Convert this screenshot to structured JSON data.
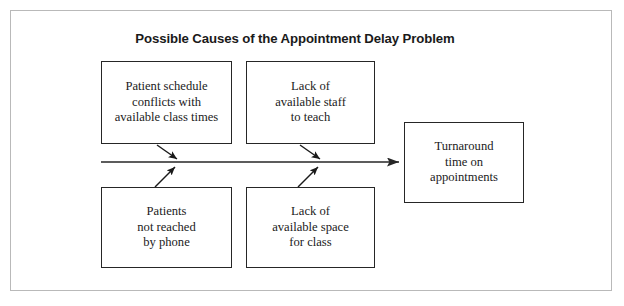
{
  "figure": {
    "title": "Possible Causes of the Appointment Delay Problem",
    "type": "cause-and-effect-fishbone-diagram",
    "frame_color": "#b9b9b9",
    "line_color": "#262626",
    "background": "#ffffff"
  },
  "causes": [
    {
      "id": "patient-schedule-conflicts",
      "position": "top-left",
      "lines": [
        "Patient schedule",
        "conflicts with",
        "available class times"
      ],
      "text": "Patient schedule conflicts with available class times"
    },
    {
      "id": "lack-available-staff",
      "position": "top-center",
      "lines": [
        "Lack of",
        "available staff",
        "to teach"
      ],
      "text": "Lack of available staff to teach"
    },
    {
      "id": "patients-not-reached",
      "position": "bottom-left",
      "lines": [
        "Patients",
        "not reached",
        "by phone"
      ],
      "text": "Patients not reached by phone"
    },
    {
      "id": "lack-available-space",
      "position": "bottom-center",
      "lines": [
        "Lack of",
        "available space",
        "for class"
      ],
      "text": "Lack of available space for class"
    }
  ],
  "effect": {
    "id": "turnaround-time",
    "lines": [
      "Turnaround",
      "time on",
      "appointments"
    ],
    "text": "Turnaround time on appointments"
  },
  "spine": {
    "label": "main-arrow",
    "direction": "left-to-right",
    "arrowhead": "right-end"
  },
  "connectors": [
    {
      "from": "patient-schedule-conflicts",
      "to": "spine",
      "direction": "down-right"
    },
    {
      "from": "lack-available-staff",
      "to": "spine",
      "direction": "down-right"
    },
    {
      "from": "patients-not-reached",
      "to": "spine",
      "direction": "up-right"
    },
    {
      "from": "lack-available-space",
      "to": "spine",
      "direction": "up-right"
    }
  ]
}
